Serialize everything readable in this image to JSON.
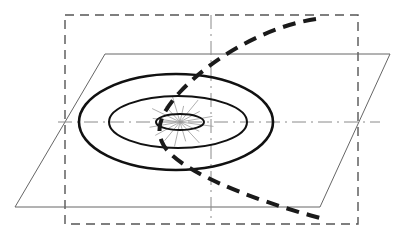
{
  "figure": {
    "canvas": {
      "width": 404,
      "height": 242,
      "background": "#ffffff"
    },
    "colors": {
      "stroke_dark": "#1a1a1a",
      "stroke_medium": "#555555",
      "stroke_light": "#777777",
      "stroke_hairline": "#999999",
      "background": "#ffffff"
    },
    "elements": {
      "bounding_dashed_rectangle": {
        "name": "outer dashed boundary rectangle",
        "x": 65,
        "y": 15,
        "width": 293,
        "height": 209,
        "stroke": "#555555",
        "stroke_width": 1.4,
        "dash_pattern": "9 6",
        "fill": "none"
      },
      "plane_parallelogram": {
        "name": "perspective ground plane",
        "points": "105,54 390,54 320,207 15,207",
        "stroke": "#666666",
        "stroke_width": 1.0,
        "fill": "none"
      },
      "horizontal_axis": {
        "name": "horizontal centre axis (dash-dot)",
        "x1": 58,
        "y1": 122,
        "x2": 380,
        "y2": 122,
        "stroke": "#8a8a8a",
        "stroke_width": 1.0,
        "dash_pattern": "14 5 2 5"
      },
      "vertical_axis": {
        "name": "vertical centre axis (dash-dot)",
        "x1": 211,
        "y1": 15,
        "x2": 211,
        "y2": 224,
        "stroke": "#8a8a8a",
        "stroke_width": 1.0,
        "dash_pattern": "14 5 2 5"
      },
      "ellipse_outer": {
        "name": "outer orbit ellipse",
        "cx": 176,
        "cy": 122,
        "rx": 97,
        "ry": 48,
        "stroke": "#111111",
        "stroke_width": 2.6,
        "fill": "none"
      },
      "ellipse_middle": {
        "name": "middle orbit ellipse",
        "cx": 178,
        "cy": 122,
        "rx": 69,
        "ry": 26,
        "stroke": "#111111",
        "stroke_width": 2.0,
        "fill": "none"
      },
      "ellipse_inner": {
        "name": "inner core ellipse",
        "cx": 180,
        "cy": 122,
        "rx": 24,
        "ry": 8,
        "stroke": "#111111",
        "stroke_width": 2.0,
        "fill": "none"
      },
      "central_burst": {
        "name": "radiating burst lines at centre",
        "cx": 180,
        "cy": 122,
        "stroke": "#9a9a9a",
        "stroke_width": 0.8,
        "ray_count": 16,
        "ray_length_x": 34,
        "ray_length_y": 26
      },
      "trajectory_curve": {
        "name": "heavy dashed trajectory curve",
        "path": "M 316 19 C 268 26 214 56 180 92 C 160 114 156 128 162 142 C 172 168 246 198 320 218",
        "stroke": "#1a1a1a",
        "stroke_width": 4.0,
        "dash_pattern": "13 8",
        "fill": "none"
      }
    },
    "labels": []
  }
}
